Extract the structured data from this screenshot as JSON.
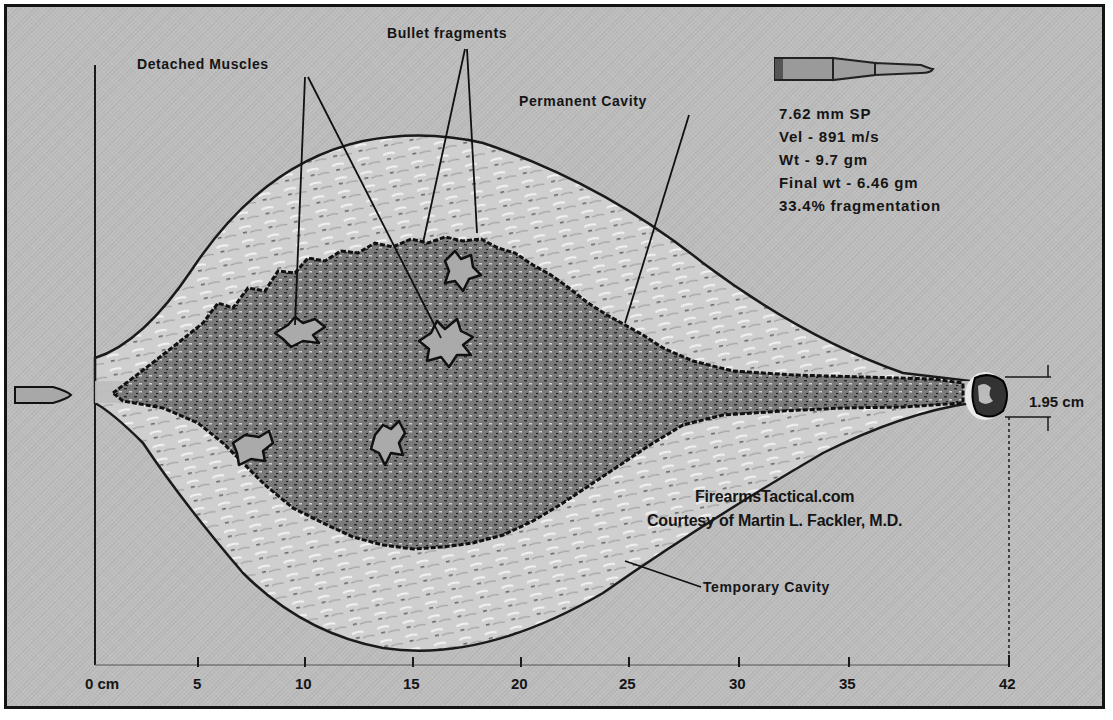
{
  "figure": {
    "labels": {
      "detached_muscles": "Detached Muscles",
      "bullet_fragments": "Bullet fragments",
      "permanent_cavity": "Permanent Cavity",
      "temporary_cavity": "Temporary Cavity"
    },
    "bullet_specs": {
      "caliber": "7.62 mm SP",
      "velocity": "Vel - 891 m/s",
      "weight": "Wt - 9.7 gm",
      "final_weight": "Final wt - 6.46 gm",
      "fragmentation": "33.4% fragmentation"
    },
    "credit": {
      "site": "FirearmsTactical.com",
      "author": "Courtesy of Martin L. Fackler, M.D."
    },
    "measurement": {
      "exit_diameter": "1.95 cm"
    },
    "axis": {
      "unit_label": "0 cm",
      "ticks": [
        "5",
        "10",
        "15",
        "20",
        "25",
        "30",
        "35",
        "42"
      ]
    },
    "colors": {
      "background": "#bdbdbd",
      "outline": "#141414",
      "temporary_cavity_fill": "#c9c9c9",
      "permanent_cavity_fill": "#6e6e6e",
      "text": "#151515"
    }
  }
}
